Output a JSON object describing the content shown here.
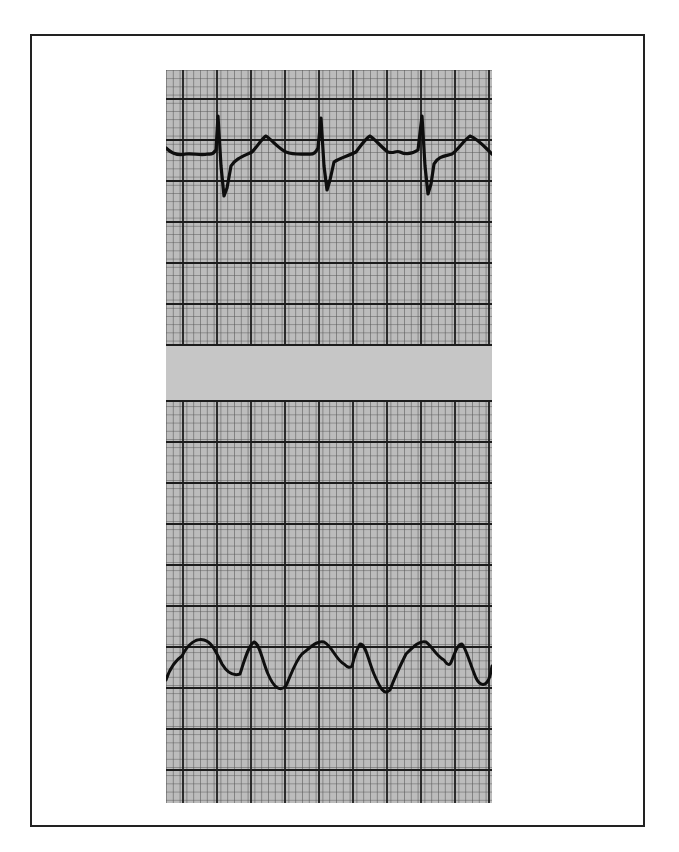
{
  "figure": {
    "type": "ecg-rhythm-strip",
    "panels": [
      {
        "name": "upper-trace",
        "description": "regular sinus-like complexes with deep S waves",
        "complex_count": 3
      },
      {
        "name": "lower-trace",
        "description": "wide sinusoidal complexes",
        "complex_count": 3
      }
    ],
    "colors": {
      "paper": "#b9b9b9",
      "grid_minor": "#4a4a4a",
      "grid_major": "#1e1e1e",
      "separator_band": "#c4c4c4",
      "trace": "#0e0e0e",
      "frame": "#222222"
    }
  }
}
